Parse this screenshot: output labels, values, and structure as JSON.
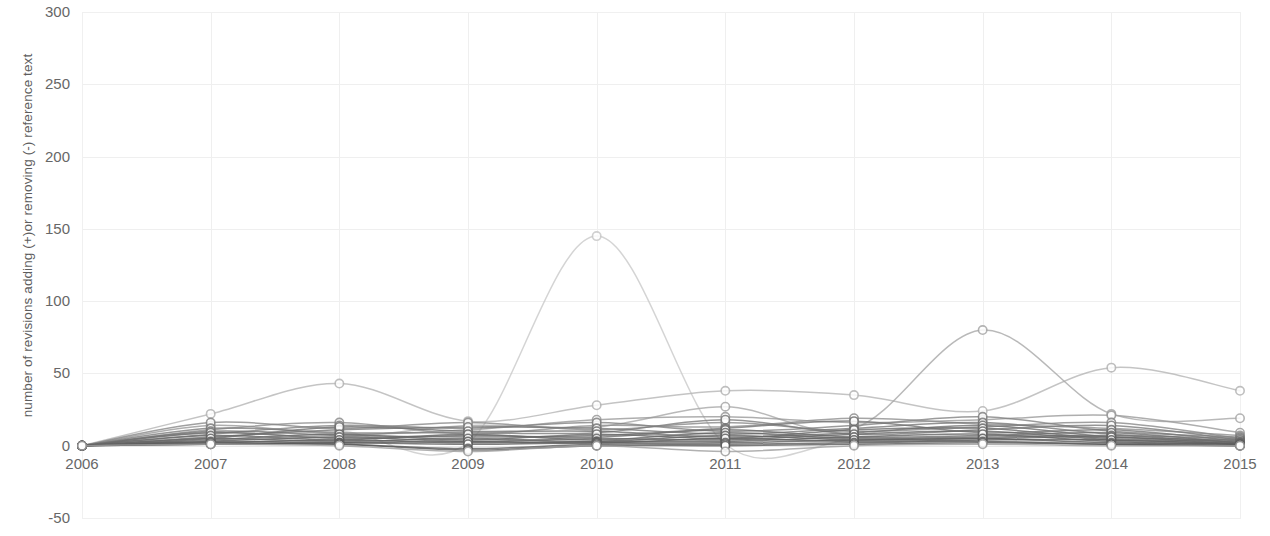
{
  "chart_data": {
    "type": "line",
    "title": "",
    "subtitle": "",
    "xlabel": "",
    "ylabel": "number of revisions adding (+)or removing (-) reference text",
    "categories": [
      "2006",
      "2007",
      "2008",
      "2009",
      "2010",
      "2011",
      "2012",
      "2013",
      "2014",
      "2015"
    ],
    "x": [
      2006,
      2007,
      2008,
      2009,
      2010,
      2011,
      2012,
      2013,
      2014,
      2015
    ],
    "ylim": [
      -50,
      300
    ],
    "yticks": [
      -50,
      0,
      50,
      100,
      150,
      200,
      250,
      300
    ],
    "ytick_labels": [
      "-50",
      "0",
      "50",
      "100",
      "150",
      "200",
      "250",
      "300"
    ],
    "xlim": [
      2006,
      2015
    ],
    "grid": true,
    "legend": "none",
    "line_smoothing": "spline",
    "marker": "circle-open",
    "series": [
      {
        "name": "series-1",
        "color": "#c9c9c9",
        "values": [
          0,
          6,
          10,
          2,
          145,
          1,
          4,
          3,
          2,
          1
        ]
      },
      {
        "name": "series-2",
        "color": "#b5b5b5",
        "values": [
          0,
          22,
          43,
          17,
          28,
          38,
          35,
          24,
          54,
          38
        ]
      },
      {
        "name": "series-3",
        "color": "#a8a8a8",
        "values": [
          0,
          9,
          6,
          14,
          13,
          27,
          12,
          80,
          22,
          19
        ]
      },
      {
        "name": "series-4",
        "color": "#9a9a9a",
        "values": [
          0,
          14,
          8,
          11,
          18,
          20,
          16,
          18,
          21,
          9
        ]
      },
      {
        "name": "series-5",
        "color": "#8e8e8e",
        "values": [
          0,
          11,
          16,
          8,
          14,
          13,
          19,
          15,
          12,
          7
        ]
      },
      {
        "name": "series-6",
        "color": "#888888",
        "values": [
          0,
          16,
          12,
          16,
          11,
          16,
          10,
          13,
          16,
          5
        ]
      },
      {
        "name": "series-7",
        "color": "#828282",
        "values": [
          0,
          8,
          14,
          12,
          16,
          10,
          14,
          20,
          10,
          6
        ]
      },
      {
        "name": "series-8",
        "color": "#7c7c7c",
        "values": [
          0,
          12,
          9,
          9,
          9,
          18,
          8,
          11,
          14,
          4
        ]
      },
      {
        "name": "series-9",
        "color": "#787878",
        "values": [
          0,
          6,
          11,
          13,
          12,
          8,
          12,
          16,
          8,
          5
        ]
      },
      {
        "name": "series-10",
        "color": "#747474",
        "values": [
          0,
          10,
          7,
          6,
          7,
          12,
          17,
          9,
          11,
          3
        ]
      },
      {
        "name": "series-11",
        "color": "#707070",
        "values": [
          0,
          5,
          13,
          10,
          10,
          6,
          9,
          14,
          6,
          4
        ]
      },
      {
        "name": "series-12",
        "color": "#6e6e6e",
        "values": [
          0,
          9,
          5,
          7,
          6,
          11,
          6,
          7,
          9,
          2
        ]
      },
      {
        "name": "series-13",
        "color": "#6a6a6a",
        "values": [
          0,
          4,
          8,
          4,
          8,
          5,
          11,
          12,
          5,
          3
        ]
      },
      {
        "name": "series-14",
        "color": "#686868",
        "values": [
          0,
          7,
          4,
          8,
          4,
          9,
          5,
          6,
          7,
          2
        ]
      },
      {
        "name": "series-15",
        "color": "#666666",
        "values": [
          0,
          3,
          6,
          3,
          5,
          4,
          8,
          10,
          4,
          2
        ]
      },
      {
        "name": "series-16",
        "color": "#646464",
        "values": [
          0,
          5,
          3,
          5,
          3,
          7,
          4,
          5,
          6,
          1
        ]
      },
      {
        "name": "series-17",
        "color": "#626262",
        "values": [
          0,
          2,
          4,
          2,
          3,
          3,
          6,
          8,
          3,
          1
        ]
      },
      {
        "name": "series-18",
        "color": "#606060",
        "values": [
          0,
          3,
          2,
          3,
          2,
          5,
          3,
          4,
          4,
          1
        ]
      },
      {
        "name": "series-19",
        "color": "#5e5e5e",
        "values": [
          0,
          1,
          2,
          1,
          2,
          2,
          4,
          5,
          2,
          1
        ]
      },
      {
        "name": "series-20",
        "color": "#5c5c5c",
        "values": [
          0,
          2,
          1,
          -2,
          1,
          1,
          2,
          3,
          1,
          0
        ]
      },
      {
        "name": "series-21",
        "color": "#5a5a5a",
        "values": [
          0,
          1,
          1,
          -3,
          0,
          0,
          1,
          2,
          1,
          0
        ]
      },
      {
        "name": "series-22",
        "color": "#9e9e9e",
        "values": [
          0,
          1,
          0,
          -4,
          0,
          -4,
          0,
          1,
          0,
          0
        ]
      }
    ]
  },
  "axes": {
    "y_title": "number of revisions adding (+)or removing (-) reference text"
  }
}
